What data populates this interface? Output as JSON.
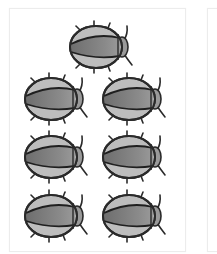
{
  "cards": [
    {
      "id": "card-1",
      "content": "beetle-counting-set",
      "beetle_count": 7,
      "layout": "1 on top, then 3 rows of 2",
      "beetles": [
        {
          "row": 1,
          "col": 1,
          "x": 68,
          "y": 20
        },
        {
          "row": 2,
          "col": 1,
          "x": 23,
          "y": 72
        },
        {
          "row": 2,
          "col": 2,
          "x": 101,
          "y": 72
        },
        {
          "row": 3,
          "col": 1,
          "x": 23,
          "y": 130
        },
        {
          "row": 3,
          "col": 2,
          "x": 101,
          "y": 130
        },
        {
          "row": 4,
          "col": 1,
          "x": 23,
          "y": 189
        },
        {
          "row": 4,
          "col": 2,
          "x": 101,
          "y": 189
        }
      ]
    },
    {
      "id": "card-2",
      "content": "partially visible empty card"
    }
  ],
  "colors": {
    "outline": "#2a2a2a",
    "elytra_band": "#7d7d7d",
    "body_edge": "#b9b9b9",
    "card_border": "#ececec"
  }
}
